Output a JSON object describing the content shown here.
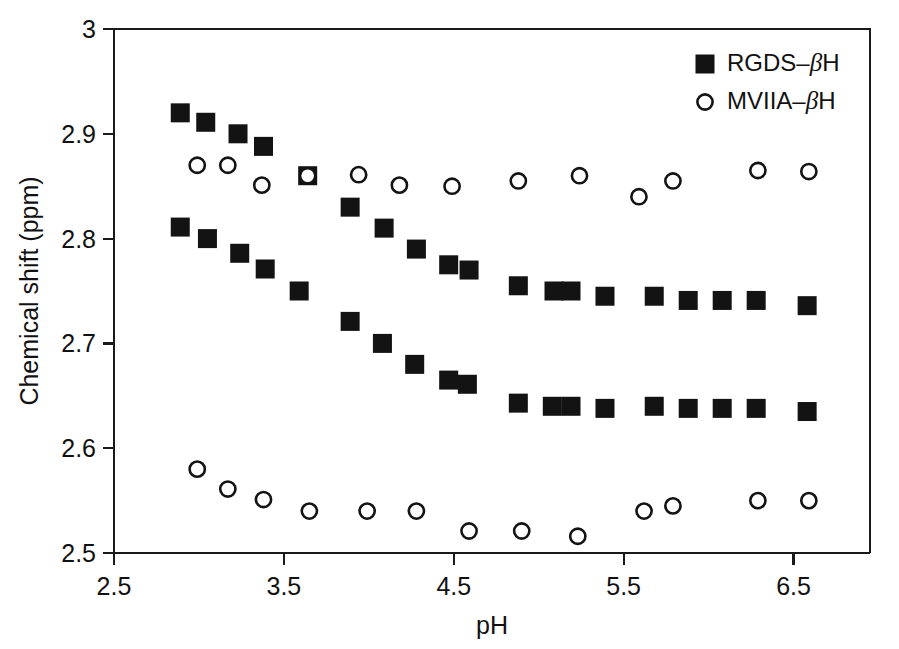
{
  "chart_data": {
    "type": "scatter",
    "title": "",
    "xlabel": "pH",
    "ylabel": "Chemical shift (ppm)",
    "xlim": [
      2.5,
      6.95
    ],
    "ylim": [
      2.5,
      3.0
    ],
    "xticks": [
      "2.5",
      "3.5",
      "4.5",
      "5.5",
      "6.5"
    ],
    "xtick_values": [
      2.5,
      3.5,
      4.5,
      5.5,
      6.5
    ],
    "yticks": [
      "2.5",
      "2.6",
      "2.7",
      "2.8",
      "2.9",
      "3"
    ],
    "ytick_values": [
      2.5,
      2.6,
      2.7,
      2.8,
      2.9,
      3.0
    ],
    "grid": false,
    "legend_position": "top-right",
    "series": [
      {
        "name": "RGDS-βH (upper branch)",
        "legend_key": "RGDS",
        "marker": "filled-square",
        "color": "#131313",
        "points": [
          [
            2.89,
            2.92
          ],
          [
            3.04,
            2.911
          ],
          [
            3.23,
            2.9
          ],
          [
            3.38,
            2.888
          ],
          [
            3.64,
            2.86
          ],
          [
            3.89,
            2.83
          ],
          [
            4.09,
            2.81
          ],
          [
            4.28,
            2.79
          ],
          [
            4.47,
            2.775
          ],
          [
            4.59,
            2.77
          ],
          [
            4.88,
            2.755
          ],
          [
            5.09,
            2.75
          ],
          [
            5.19,
            2.75
          ],
          [
            5.39,
            2.745
          ],
          [
            5.68,
            2.745
          ],
          [
            5.88,
            2.741
          ],
          [
            6.08,
            2.741
          ],
          [
            6.28,
            2.741
          ],
          [
            6.58,
            2.736
          ]
        ]
      },
      {
        "name": "RGDS-βH (lower branch)",
        "legend_key": "RGDS",
        "marker": "filled-square",
        "color": "#131313",
        "points": [
          [
            2.89,
            2.811
          ],
          [
            3.05,
            2.8
          ],
          [
            3.24,
            2.786
          ],
          [
            3.39,
            2.771
          ],
          [
            3.59,
            2.75
          ],
          [
            3.89,
            2.721
          ],
          [
            4.08,
            2.7
          ],
          [
            4.27,
            2.68
          ],
          [
            4.47,
            2.665
          ],
          [
            4.58,
            2.661
          ],
          [
            4.88,
            2.643
          ],
          [
            5.08,
            2.64
          ],
          [
            5.19,
            2.64
          ],
          [
            5.39,
            2.638
          ],
          [
            5.68,
            2.64
          ],
          [
            5.88,
            2.638
          ],
          [
            6.08,
            2.638
          ],
          [
            6.28,
            2.638
          ],
          [
            6.58,
            2.635
          ]
        ]
      },
      {
        "name": "MVIIA-βH (upper branch)",
        "legend_key": "MVIIA",
        "marker": "open-circle",
        "color": "#131313",
        "points": [
          [
            2.99,
            2.87
          ],
          [
            3.17,
            2.87
          ],
          [
            3.37,
            2.851
          ],
          [
            3.64,
            2.86
          ],
          [
            3.94,
            2.861
          ],
          [
            4.18,
            2.851
          ],
          [
            4.49,
            2.85
          ],
          [
            4.88,
            2.855
          ],
          [
            5.24,
            2.86
          ],
          [
            5.59,
            2.84
          ],
          [
            5.79,
            2.855
          ],
          [
            6.29,
            2.865
          ],
          [
            6.59,
            2.864
          ]
        ]
      },
      {
        "name": "MVIIA-βH (lower branch)",
        "legend_key": "MVIIA",
        "marker": "open-circle",
        "color": "#131313",
        "points": [
          [
            2.99,
            2.58
          ],
          [
            3.17,
            2.561
          ],
          [
            3.38,
            2.551
          ],
          [
            3.65,
            2.54
          ],
          [
            3.99,
            2.54
          ],
          [
            4.28,
            2.54
          ],
          [
            4.59,
            2.521
          ],
          [
            4.9,
            2.521
          ],
          [
            5.23,
            2.516
          ],
          [
            5.62,
            2.54
          ],
          [
            5.79,
            2.545
          ],
          [
            6.29,
            2.55
          ],
          [
            6.59,
            2.55
          ]
        ]
      }
    ],
    "legend": [
      {
        "label_prefix": "RGDS",
        "label_dash": "–",
        "label_beta": "β",
        "label_suffix": "H",
        "marker": "filled-square"
      },
      {
        "label_prefix": "MVIIA",
        "label_dash": "–",
        "label_beta": "β",
        "label_suffix": "H",
        "marker": "open-circle"
      }
    ]
  }
}
